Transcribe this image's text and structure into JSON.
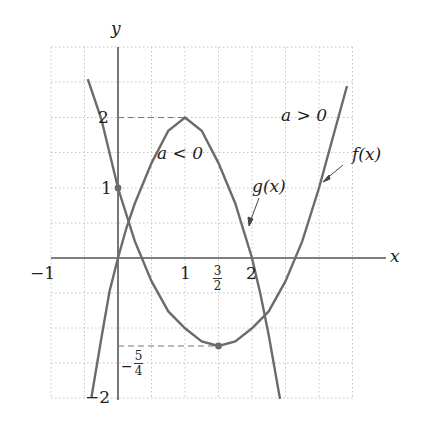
{
  "diagram": {
    "axes": {
      "x_label": "x",
      "y_label": "y",
      "x_ticks": [
        "−1",
        "1",
        "2"
      ],
      "x_fraction_tick": {
        "numerator": "3",
        "denominator": "2"
      },
      "y_ticks": [
        "2",
        "1",
        "−2"
      ],
      "y_fraction_tick": {
        "sign": "−",
        "numerator": "5",
        "denominator": "4"
      }
    },
    "curves": [
      {
        "name": "f(x)",
        "label": "f(x)",
        "condition": "a > 0",
        "equation": "y = x^2 - 3x + 1",
        "vertex": [
          1.5,
          -1.25
        ],
        "y_intercept": 1
      },
      {
        "name": "g(x)",
        "label": "g(x)",
        "condition": "a < 0",
        "equation": "y = -2x^2 + 4x",
        "vertex": [
          1,
          2
        ],
        "roots": [
          0,
          2
        ]
      }
    ],
    "annotations": {
      "a_pos": "a > 0",
      "a_neg": "a < 0",
      "f_label": "f(x)",
      "g_label": "g(x)"
    },
    "colors": {
      "curve": "#6b6b6b",
      "grid": "#bdbdbd",
      "axis": "#555555",
      "text": "#222222"
    }
  }
}
